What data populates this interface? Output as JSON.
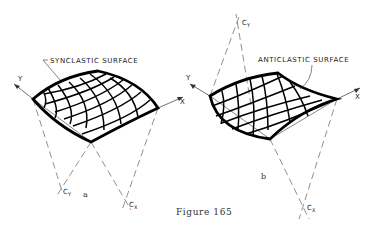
{
  "figure": {
    "caption": "Figure 165",
    "panels": [
      {
        "id": "a",
        "sublabel": "a",
        "title": "SYNCLASTIC SURFACE",
        "axes": {
          "x": "X",
          "y": "Y"
        },
        "centers": [
          {
            "label": "C",
            "sub": "Y"
          },
          {
            "label": "C",
            "sub": "X"
          }
        ]
      },
      {
        "id": "b",
        "sublabel": "b",
        "title": "ANTICLASTIC SURFACE",
        "axes": {
          "x": "X",
          "y": "Y"
        },
        "centers": [
          {
            "label": "C",
            "sub": "Y"
          },
          {
            "label": "C",
            "sub": "X"
          }
        ]
      }
    ]
  }
}
